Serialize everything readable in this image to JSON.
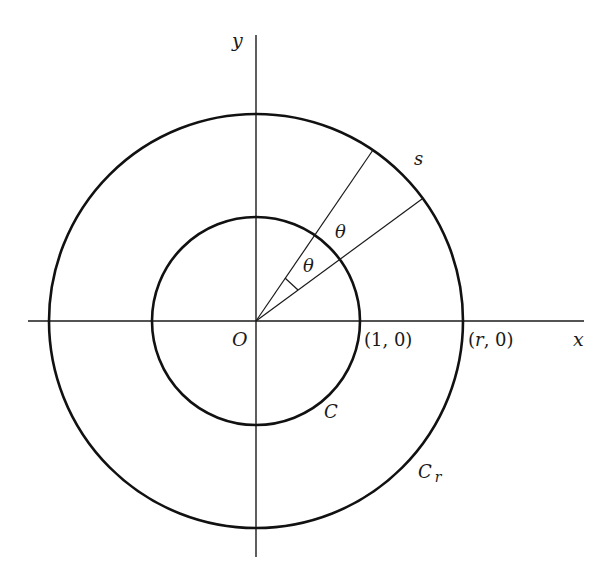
{
  "diagram": {
    "type": "geometry-figure",
    "colors": {
      "stroke": "#1a1a1a",
      "background": "#ffffff"
    },
    "axes": {
      "x_label": "x",
      "y_label": "y",
      "origin_label": "O"
    },
    "circles": [
      {
        "name": "C",
        "label": "C",
        "radius_label": "1",
        "point_label": "(1, 0)"
      },
      {
        "name": "C_r",
        "label": "C",
        "label_subscript": "r",
        "radius_label": "r",
        "point_label": "(r, 0)"
      }
    ],
    "angles": {
      "inner_label": "θ",
      "outer_label": "θ"
    },
    "arc_label": "s"
  }
}
